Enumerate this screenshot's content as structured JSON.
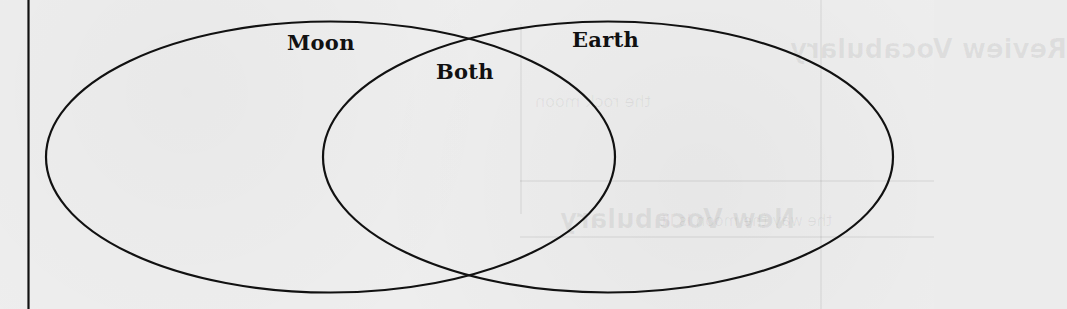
{
  "diagram": {
    "type": "venn",
    "colors": {
      "stroke": "#111111",
      "background": "#eeeeee",
      "text": "#111111"
    },
    "sets": [
      {
        "id": "moon",
        "label": "Moon"
      },
      {
        "id": "earth",
        "label": "Earth"
      }
    ],
    "intersection": {
      "label": "Both"
    }
  },
  "bleed_through": {
    "text_1": "Review Vocabulary",
    "text_2": "the rock moon",
    "text_3": "New Vocabulary",
    "text_4": "the way the moon is lit"
  }
}
